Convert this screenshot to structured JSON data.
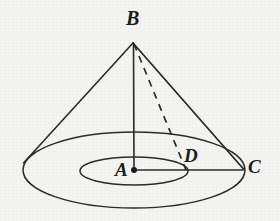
{
  "figure": {
    "type": "geometry-diagram",
    "stroke_color": "#2a2a2a",
    "background_color": "#f4f4f2",
    "labels": {
      "apex": "B",
      "center": "A",
      "inner_point": "D",
      "rim_point": "C"
    },
    "points": {
      "B": {
        "label": "B",
        "x": 133,
        "y": 42
      },
      "A": {
        "label": "A",
        "x": 134,
        "y": 170
      },
      "C": {
        "label": "C",
        "x": 243,
        "y": 170
      },
      "D": {
        "label": "D",
        "x": 188,
        "y": 170
      }
    },
    "base_circle": {
      "name": "outer-base-ellipse",
      "cx": 134,
      "cy": 170,
      "rx": 111,
      "ry": 38
    },
    "inner_circle": {
      "name": "inner-ellipse",
      "cx": 134,
      "cy": 171,
      "rx": 54,
      "ry": 14
    },
    "segments": [
      {
        "name": "left-slant",
        "from": "B",
        "to": "left-rim",
        "style": "solid"
      },
      {
        "name": "right-slant",
        "from": "B",
        "to": "C",
        "style": "solid"
      },
      {
        "name": "axis-BA",
        "from": "B",
        "to": "A",
        "style": "solid"
      },
      {
        "name": "radius-AC",
        "from": "A",
        "to": "C",
        "style": "solid"
      },
      {
        "name": "slant-BD",
        "from": "B",
        "to": "D",
        "style": "dashed"
      }
    ]
  }
}
